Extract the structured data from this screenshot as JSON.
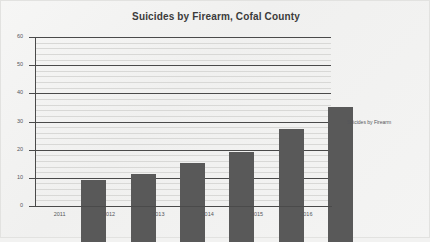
{
  "chart_data": {
    "type": "bar",
    "title": "Suicides by Firearm, Cofal County",
    "xlabel": "",
    "ylabel": "",
    "categories": [
      "2011",
      "2012",
      "2013",
      "2014",
      "2015",
      "2016"
    ],
    "values": [
      22,
      24,
      28,
      32,
      40,
      48
    ],
    "series": [
      {
        "name": "Suicides by Firearm",
        "values": [
          22,
          24,
          28,
          32,
          40,
          48
        ]
      }
    ],
    "ylim": [
      0,
      60
    ],
    "y_ticks": [
      0,
      10,
      20,
      30,
      40,
      50,
      60
    ],
    "y_tick_labels": [
      "0",
      "10",
      "20",
      "30",
      "40",
      "50",
      "60"
    ],
    "minor_tick_step": 2,
    "grid": true,
    "grid_axis": "y",
    "legend": {
      "position": "right",
      "entries": [
        {
          "label": "Suicides by Firearm",
          "color": "#595959",
          "marker": "square-marker"
        }
      ]
    },
    "colors": {
      "bar": "#595959",
      "major_gridline": "#4a4a4a",
      "minor_gridline": "#d8d8d6",
      "axis": "#4a4a4a",
      "title_text": "#3b3b3b",
      "tick_text": "#55565a",
      "background": "#f2f2f1"
    }
  }
}
